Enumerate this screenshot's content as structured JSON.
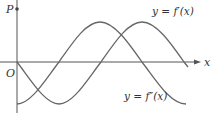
{
  "figure": {
    "point_label": "P",
    "origin_label": "O",
    "x_axis_label": "x",
    "curves": [
      {
        "id": "f-prime",
        "label": "y = f′(x)",
        "shape": "-sin",
        "color": "#666666"
      },
      {
        "id": "f-double-prime",
        "label": "y = f″(x)",
        "shape": "-cos",
        "color": "#666666"
      }
    ],
    "axis_color": "#555555"
  }
}
